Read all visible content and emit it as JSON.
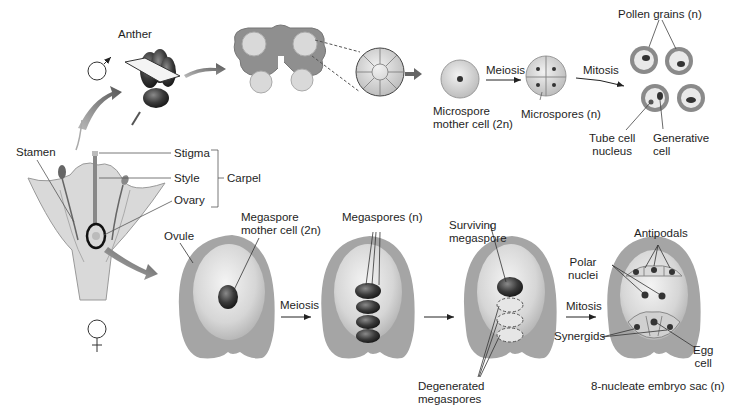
{
  "diagram": {
    "male_symbol": "♂",
    "female_symbol": "♀",
    "male_pathway": {
      "anther": "Anther",
      "microspore_mother_cell_1": "Microspore",
      "microspore_mother_cell_2": "mother cell (2n)",
      "meiosis": "Meiosis",
      "microspores": "Microspores (n)",
      "mitosis": "Mitosis",
      "pollen_grains": "Pollen grains (n)",
      "tube_cell_1": "Tube cell",
      "tube_cell_2": "nucleus",
      "generative_1": "Generative",
      "generative_2": "cell"
    },
    "flower": {
      "stamen": "Stamen",
      "stigma": "Stigma",
      "style": "Style",
      "ovary": "Ovary",
      "carpel": "Carpel"
    },
    "female_pathway": {
      "ovule": "Ovule",
      "megaspore_mother_cell_1": "Megaspore",
      "megaspore_mother_cell_2": "mother cell (2n)",
      "meiosis": "Meiosis",
      "megaspores": "Megaspores (n)",
      "surviving_1": "Surviving",
      "surviving_2": "megaspore",
      "degenerated_1": "Degenerated",
      "degenerated_2": "megaspores",
      "mitosis": "Mitosis",
      "antipodals": "Antipodals",
      "polar_1": "Polar",
      "polar_2": "nuclei",
      "synergids": "Synergids",
      "egg_1": "Egg",
      "egg_2": "cell",
      "embryo_sac": "8-nucleate embryo sac (n)"
    }
  }
}
